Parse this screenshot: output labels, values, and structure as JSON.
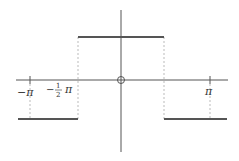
{
  "diagram": {
    "colors": {
      "axis": "#555555",
      "bars": "#555555",
      "dashed": "#aaaaaa",
      "text": "#333333"
    },
    "labels": {
      "neg_pi": "−π",
      "neg_half_minus": "−",
      "neg_half_num": "1",
      "neg_half_den": "2",
      "neg_half_pi": "π",
      "pos_pi": "π",
      "origin": "O"
    },
    "segments": [
      {
        "name": "lower-left",
        "from": "-π",
        "to": "-π/2",
        "level": "low"
      },
      {
        "name": "upper-middle",
        "from": "-π/2",
        "to": "π/2",
        "level": "high"
      },
      {
        "name": "lower-right",
        "from": "π/2",
        "to": "π",
        "level": "low"
      }
    ]
  }
}
